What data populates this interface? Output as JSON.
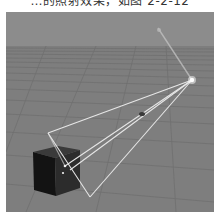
{
  "caption": {
    "text": "…的照射效果，如图 2-2-12"
  },
  "scene": {
    "description": "3D viewport: spot light above grid floor illuminating a dark cube",
    "colors": {
      "sky": "#8c8c8c",
      "floor": "#7e7e7e",
      "grid_line": "#6e6e6e",
      "cone_line": "#e8e8e8",
      "cube_front": "#141414",
      "cube_side": "#2e2e2e",
      "cube_top": "#3a3a3a",
      "light": "#ffffff"
    },
    "objects": [
      "spot-light",
      "light-cone",
      "target-marker",
      "cube",
      "floor-grid"
    ]
  }
}
